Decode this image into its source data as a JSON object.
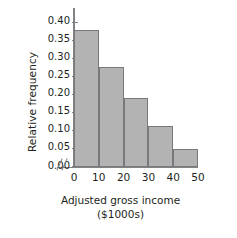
{
  "chart_data": {
    "type": "bar",
    "title": "",
    "subtitle": "",
    "xlabel": "Adjusted gross income",
    "xlabel_units": "($1000s)",
    "ylabel": "Relative frequency",
    "categories": [
      "0-10",
      "10-20",
      "20-30",
      "30-40",
      "40-50"
    ],
    "bin_edges": [
      0,
      10,
      20,
      30,
      40,
      50
    ],
    "values": [
      0.38,
      0.275,
      0.19,
      0.112,
      0.048
    ],
    "xticks": [
      "0",
      "10",
      "20",
      "30",
      "40",
      "50"
    ],
    "xtick_values": [
      0,
      10,
      20,
      30,
      40,
      50
    ],
    "yticks": [
      "0.00",
      "0.05",
      "0.10",
      "0.15",
      "0.20",
      "0.25",
      "0.30",
      "0.35",
      "0.40"
    ],
    "ytick_values": [
      0.0,
      0.05,
      0.1,
      0.15,
      0.2,
      0.25,
      0.3,
      0.35,
      0.4
    ],
    "ylim": [
      0,
      0.44
    ],
    "xlim": [
      0,
      50
    ],
    "grid": false,
    "legend": false,
    "axis_break": "//",
    "bar_fill_color": "#b3b3b3",
    "bar_border_color": "#77797c",
    "axis_color": "#808285",
    "text_color": "#231f20",
    "background_color": "#ffffff"
  }
}
